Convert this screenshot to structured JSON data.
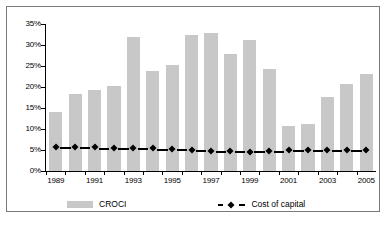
{
  "chart_data": {
    "type": "bar",
    "title": "",
    "xlabel": "",
    "ylabel": "",
    "ylim": [
      0,
      35
    ],
    "ytick_labels": [
      "35%",
      "30%",
      "25%",
      "20%",
      "15%",
      "10%",
      "5%",
      "0%"
    ],
    "ytick_values": [
      35,
      30,
      25,
      20,
      15,
      10,
      5,
      0
    ],
    "grid": false,
    "legend_position": "bottom",
    "categories": [
      "1989",
      "1990",
      "1991",
      "1992",
      "1993",
      "1994",
      "1995",
      "1996",
      "1997",
      "1998",
      "1999",
      "2000",
      "2001",
      "2002",
      "2003",
      "2004",
      "2005"
    ],
    "xtick_labels_shown": [
      "1989",
      "",
      "1991",
      "",
      "1993",
      "",
      "1995",
      "",
      "1997",
      "",
      "1999",
      "",
      "2001",
      "",
      "2003",
      "",
      "2005"
    ],
    "series": [
      {
        "name": "CROCI",
        "type": "bar",
        "color": "#c8c8c8",
        "values": [
          14.1,
          18.4,
          19.4,
          20.2,
          31.8,
          23.7,
          25.2,
          32.3,
          32.9,
          27.8,
          31.2,
          24.3,
          10.6,
          11.1,
          17.6,
          20.7,
          23.0
        ]
      },
      {
        "name": "Cost of capital",
        "type": "line",
        "color": "#000000",
        "marker": "diamond",
        "linestyle": "dashed",
        "values": [
          5.8,
          5.7,
          5.6,
          5.4,
          5.4,
          5.4,
          5.3,
          5.1,
          4.8,
          4.7,
          4.6,
          4.7,
          4.9,
          5.0,
          5.0,
          4.9,
          4.9
        ]
      }
    ]
  },
  "legend": {
    "croci_label": "CROCI",
    "cost_of_capital_label": "Cost of capital"
  },
  "caption": {
    "text": ""
  }
}
